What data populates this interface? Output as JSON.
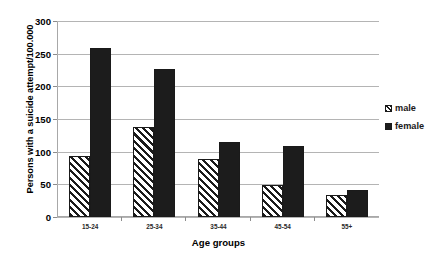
{
  "chart_data": {
    "type": "bar",
    "title": "",
    "subtitle": "",
    "xlabel": "Age groups",
    "ylabel": "Persons with a suicide attempt/100.000",
    "categories": [
      "15-24",
      "25-34",
      "35-44",
      "45-54",
      "55+"
    ],
    "series": [
      {
        "name": "male",
        "values": [
          93,
          138,
          89,
          49,
          34
        ],
        "color": "#ffffff",
        "pattern": "diagonal-hatch"
      },
      {
        "name": "female",
        "values": [
          258,
          227,
          115,
          108,
          41
        ],
        "color": "#1c1c1c",
        "pattern": "solid"
      }
    ],
    "ylim": [
      0,
      300
    ],
    "ytick_step": 50,
    "yticks": [
      300,
      250,
      200,
      150,
      100,
      50,
      0
    ],
    "ytick_labels": [
      "300",
      "250",
      "200",
      "150",
      "100",
      "50",
      "0"
    ],
    "grid": true,
    "grid_axis": "y",
    "legend": {
      "position": "right",
      "entries": [
        "male",
        "female"
      ]
    },
    "colors": {
      "bar_outline": "#1a1a1a",
      "female_fill": "#1c1c1c",
      "male_fill": "#ffffff",
      "gridline": "#b4b4b4",
      "axis": "#a8a8a8",
      "text": "#000000",
      "background": "#ffffff"
    }
  },
  "legend": {
    "items": [
      {
        "label": "male"
      },
      {
        "label": "female"
      }
    ]
  },
  "axes": {
    "y_title": "Persons with a suicide attempt/100.000",
    "x_title": "Age groups"
  }
}
